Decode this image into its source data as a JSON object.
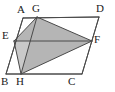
{
  "figure": {
    "background_color": "#ffffff",
    "stroke_color": "#4a4a4a",
    "stroke_width": 1,
    "shade_color": "#b5b5b5",
    "shade_light_color": "#cfcfcf",
    "label_color": "#1a1a1a",
    "points": {
      "A": {
        "label": "A",
        "x": 23,
        "y": 18,
        "label_x": 17,
        "label_y": 4
      },
      "B": {
        "label": "B",
        "x": 6,
        "y": 74,
        "label_x": 1,
        "label_y": 76
      },
      "C": {
        "label": "C",
        "x": 82,
        "y": 74,
        "label_x": 68,
        "label_y": 76
      },
      "D": {
        "label": "D",
        "x": 99,
        "y": 17,
        "label_x": 96,
        "label_y": 3
      },
      "E": {
        "label": "E",
        "x": 14,
        "y": 41,
        "label_x": 2,
        "label_y": 30
      },
      "F": {
        "label": "F",
        "x": 92,
        "y": 41,
        "label_x": 94,
        "label_y": 34
      },
      "G": {
        "label": "G",
        "x": 37,
        "y": 17,
        "label_x": 32,
        "label_y": 3
      },
      "H": {
        "label": "H",
        "x": 21,
        "y": 74,
        "label_x": 16,
        "label_y": 76
      }
    },
    "outline": {
      "name": "parallelogram-ABCD",
      "path": "23,18 99,17 82,74 6,74"
    },
    "shaded_regions": [
      {
        "name": "shaded-quad-EGFH",
        "path": "14,41 37,17 92,41 21,74",
        "fill": "#b5b5b5"
      },
      {
        "name": "light-triangle-EXH",
        "path": "14,41 30,41 21,74",
        "fill": "#c9c9c9"
      }
    ],
    "segments": [
      {
        "name": "segment-AB",
        "from": "A",
        "to": "B"
      },
      {
        "name": "segment-BC",
        "from": "B",
        "to": "C"
      },
      {
        "name": "segment-CD",
        "from": "C",
        "to": "D"
      },
      {
        "name": "segment-DA",
        "from": "D",
        "to": "A"
      },
      {
        "name": "segment-EF",
        "from": "E",
        "to": "F"
      },
      {
        "name": "segment-GH",
        "from": "G",
        "to": "H"
      },
      {
        "name": "segment-EG",
        "from": "E",
        "to": "G"
      },
      {
        "name": "segment-GF",
        "from": "G",
        "to": "F"
      },
      {
        "name": "segment-FH",
        "from": "F",
        "to": "H"
      },
      {
        "name": "segment-EH",
        "from": "E",
        "to": "H"
      }
    ]
  }
}
